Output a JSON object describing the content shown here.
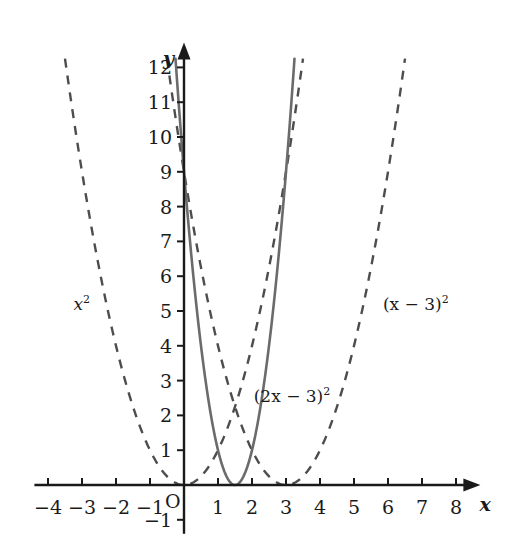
{
  "chart_data": {
    "type": "line",
    "title": "",
    "xlabel": "x",
    "ylabel": "y",
    "xlim": [
      -4.4,
      8.6
    ],
    "ylim": [
      -1.4,
      12.6
    ],
    "grid": false,
    "legend_position": "inline-annotations",
    "x_ticks": [
      -4,
      -3,
      -2,
      -1,
      1,
      2,
      3,
      4,
      5,
      6,
      7,
      8
    ],
    "x_tick_labels": [
      "−4",
      "−3",
      "−2",
      "−1",
      "1",
      "2",
      "3",
      "4",
      "5",
      "6",
      "7",
      "8"
    ],
    "y_ticks": [
      -1,
      1,
      2,
      3,
      4,
      5,
      6,
      7,
      8,
      9,
      10,
      11,
      12
    ],
    "y_tick_labels": [
      "−1",
      "1",
      "2",
      "3",
      "4",
      "5",
      "6",
      "7",
      "8",
      "9",
      "10",
      "11",
      "12"
    ],
    "origin_label": "O",
    "series": [
      {
        "name": "x^2",
        "label_html": "x<sup>2</sup>",
        "style": "dashed",
        "color": "#4d4d4d",
        "vertex": [
          0,
          0
        ],
        "a": 1,
        "h": 0,
        "k": 0,
        "x_domain": [
          -3.5,
          3.5
        ],
        "label_position": [
          -3.25,
          5.5
        ]
      },
      {
        "name": "(2x-3)^2",
        "label_html": "(2x − 3)<sup>2</sup>",
        "style": "solid",
        "color": "#6b6b6b",
        "vertex": [
          1.5,
          0
        ],
        "a": 4,
        "h": 1.5,
        "k": 0,
        "x_domain": [
          -0.25,
          3.25
        ],
        "label_position": [
          2.05,
          2.85
        ]
      },
      {
        "name": "(x-3)^2",
        "label_html": "(x − 3)<sup>2</sup>",
        "style": "dashed",
        "color": "#4d4d4d",
        "vertex": [
          3,
          0
        ],
        "a": 1,
        "h": 3,
        "k": 0,
        "x_domain": [
          -0.5,
          6.5
        ],
        "label_position": [
          5.85,
          5.5
        ]
      }
    ]
  },
  "axes": {
    "x_axis_name": "x",
    "y_axis_name": "y",
    "origin": "O",
    "axis_color": "#1a1a1a"
  },
  "labels": {
    "curve_left": "x",
    "curve_left_exp": "2",
    "curve_middle_open": "(2x − 3)",
    "curve_middle_exp": "2",
    "curve_right_open": "(x − 3)",
    "curve_right_exp": "2"
  },
  "ticks": {
    "x": [
      "−4",
      "−3",
      "−2",
      "−1",
      "1",
      "2",
      "3",
      "4",
      "5",
      "6",
      "7",
      "8"
    ],
    "y": [
      "12",
      "11",
      "10",
      "9",
      "8",
      "7",
      "6",
      "5",
      "4",
      "3",
      "2",
      "1",
      "−1"
    ]
  }
}
